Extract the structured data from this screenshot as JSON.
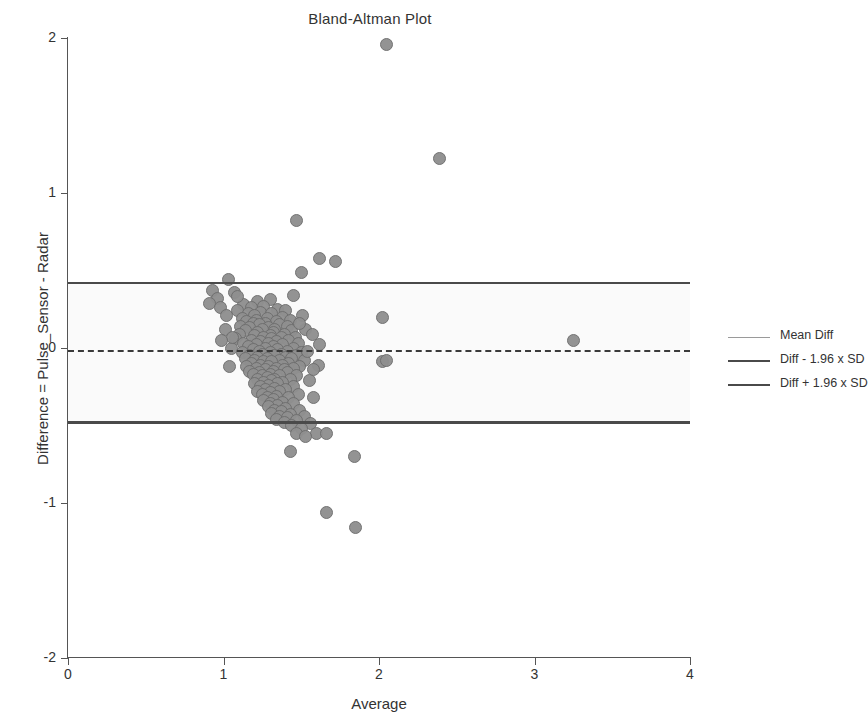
{
  "chart_data": {
    "type": "scatter",
    "title": "Bland-Altman Plot",
    "xlabel": "Average",
    "ylabel": "Difference = Pulse_Sensor - Radar",
    "xlim": [
      0,
      4
    ],
    "ylim": [
      -2,
      2
    ],
    "xticks": [
      "0",
      "1",
      "2",
      "3",
      "4"
    ],
    "yticks": [
      "2",
      "1",
      "0",
      "-1",
      "-2"
    ],
    "grid": false,
    "legend_position": "right",
    "marker": {
      "shape": "circle",
      "fill": "#8f8f8f",
      "edge": "#6e6e6e",
      "size": 13
    },
    "reference_lines": [
      {
        "name": "Mean Diff",
        "value": -0.02,
        "style": "dashed",
        "color": "#3a3a3a"
      },
      {
        "name": "Diff - 1.96 x SD",
        "value": -0.48,
        "style": "solid",
        "color": "#4a4a4a"
      },
      {
        "name": "Diff + 1.96 x SD",
        "value": 0.42,
        "style": "solid",
        "color": "#4a4a4a"
      }
    ],
    "band": {
      "from": -0.48,
      "to": 0.42,
      "color": "#fafafa"
    },
    "legend": [
      {
        "label": "Mean Diff",
        "swatch": "light"
      },
      {
        "label": "Diff - 1.96 x SD",
        "swatch": "solid"
      },
      {
        "label": "Diff + 1.96 x SD",
        "swatch": "solid"
      }
    ],
    "points": [
      [
        2.05,
        1.96
      ],
      [
        2.39,
        1.22
      ],
      [
        1.47,
        0.82
      ],
      [
        1.62,
        0.58
      ],
      [
        1.72,
        0.56
      ],
      [
        1.5,
        0.49
      ],
      [
        1.03,
        0.44
      ],
      [
        0.93,
        0.37
      ],
      [
        1.07,
        0.36
      ],
      [
        1.45,
        0.34
      ],
      [
        0.96,
        0.32
      ],
      [
        1.22,
        0.3
      ],
      [
        1.3,
        0.31
      ],
      [
        1.13,
        0.28
      ],
      [
        1.26,
        0.27
      ],
      [
        1.18,
        0.26
      ],
      [
        1.35,
        0.25
      ],
      [
        1.4,
        0.24
      ],
      [
        1.09,
        0.24
      ],
      [
        1.24,
        0.23
      ],
      [
        1.16,
        0.22
      ],
      [
        1.31,
        0.22
      ],
      [
        1.2,
        0.21
      ],
      [
        1.38,
        0.2
      ],
      [
        2.02,
        0.2
      ],
      [
        1.12,
        0.19
      ],
      [
        1.28,
        0.19
      ],
      [
        1.43,
        0.18
      ],
      [
        1.21,
        0.18
      ],
      [
        1.34,
        0.17
      ],
      [
        1.15,
        0.17
      ],
      [
        1.27,
        0.16
      ],
      [
        1.19,
        0.16
      ],
      [
        1.36,
        0.15
      ],
      [
        1.23,
        0.15
      ],
      [
        1.41,
        0.14
      ],
      [
        1.11,
        0.14
      ],
      [
        1.29,
        0.13
      ],
      [
        1.17,
        0.13
      ],
      [
        1.33,
        0.12
      ],
      [
        1.25,
        0.12
      ],
      [
        1.44,
        0.11
      ],
      [
        1.14,
        0.11
      ],
      [
        1.32,
        0.1
      ],
      [
        1.22,
        0.1
      ],
      [
        1.39,
        0.09
      ],
      [
        1.1,
        0.09
      ],
      [
        1.3,
        0.08
      ],
      [
        1.2,
        0.08
      ],
      [
        1.37,
        0.07
      ],
      [
        1.26,
        0.07
      ],
      [
        1.46,
        0.07
      ],
      [
        1.08,
        0.06
      ],
      [
        1.31,
        0.06
      ],
      [
        1.18,
        0.05
      ],
      [
        1.42,
        0.05
      ],
      [
        1.24,
        0.04
      ],
      [
        1.34,
        0.04
      ],
      [
        1.13,
        0.03
      ],
      [
        1.29,
        0.03
      ],
      [
        1.48,
        0.03
      ],
      [
        1.21,
        0.02
      ],
      [
        1.38,
        0.02
      ],
      [
        1.16,
        0.01
      ],
      [
        1.32,
        0.01
      ],
      [
        1.05,
        0.0
      ],
      [
        1.27,
        0.0
      ],
      [
        1.45,
        0.0
      ],
      [
        1.19,
        -0.01
      ],
      [
        1.35,
        -0.01
      ],
      [
        1.23,
        -0.02
      ],
      [
        1.41,
        -0.02
      ],
      [
        1.12,
        -0.03
      ],
      [
        1.3,
        -0.03
      ],
      [
        1.5,
        -0.03
      ],
      [
        1.25,
        -0.04
      ],
      [
        1.37,
        -0.04
      ],
      [
        1.17,
        -0.05
      ],
      [
        1.33,
        -0.05
      ],
      [
        1.47,
        -0.05
      ],
      [
        1.22,
        -0.06
      ],
      [
        1.4,
        -0.06
      ],
      [
        1.14,
        -0.07
      ],
      [
        1.28,
        -0.07
      ],
      [
        1.44,
        -0.07
      ],
      [
        1.2,
        -0.08
      ],
      [
        1.36,
        -0.08
      ],
      [
        1.52,
        -0.08
      ],
      [
        1.26,
        -0.09
      ],
      [
        1.31,
        -0.09
      ],
      [
        1.18,
        -0.1
      ],
      [
        1.42,
        -0.1
      ],
      [
        1.24,
        -0.11
      ],
      [
        1.38,
        -0.11
      ],
      [
        1.15,
        -0.12
      ],
      [
        1.29,
        -0.12
      ],
      [
        1.49,
        -0.12
      ],
      [
        1.21,
        -0.13
      ],
      [
        1.34,
        -0.13
      ],
      [
        1.45,
        -0.13
      ],
      [
        1.27,
        -0.14
      ],
      [
        1.39,
        -0.14
      ],
      [
        1.17,
        -0.15
      ],
      [
        1.32,
        -0.15
      ],
      [
        1.23,
        -0.16
      ],
      [
        1.41,
        -0.16
      ],
      [
        1.3,
        -0.17
      ],
      [
        1.19,
        -0.17
      ],
      [
        1.36,
        -0.18
      ],
      [
        1.25,
        -0.18
      ],
      [
        1.47,
        -0.18
      ],
      [
        1.28,
        -0.19
      ],
      [
        1.33,
        -0.2
      ],
      [
        1.22,
        -0.2
      ],
      [
        1.43,
        -0.2
      ],
      [
        1.31,
        -0.21
      ],
      [
        1.26,
        -0.22
      ],
      [
        1.38,
        -0.22
      ],
      [
        1.2,
        -0.23
      ],
      [
        1.35,
        -0.23
      ],
      [
        1.29,
        -0.24
      ],
      [
        1.24,
        -0.25
      ],
      [
        1.45,
        -0.25
      ],
      [
        1.33,
        -0.26
      ],
      [
        1.27,
        -0.27
      ],
      [
        1.4,
        -0.27
      ],
      [
        1.22,
        -0.28
      ],
      [
        1.36,
        -0.28
      ],
      [
        1.3,
        -0.29
      ],
      [
        1.25,
        -0.3
      ],
      [
        1.48,
        -0.3
      ],
      [
        1.34,
        -0.31
      ],
      [
        1.28,
        -0.32
      ],
      [
        1.58,
        -0.32
      ],
      [
        1.42,
        -0.32
      ],
      [
        1.32,
        -0.33
      ],
      [
        1.26,
        -0.34
      ],
      [
        1.38,
        -0.35
      ],
      [
        1.3,
        -0.36
      ],
      [
        1.45,
        -0.36
      ],
      [
        1.35,
        -0.37
      ],
      [
        1.29,
        -0.38
      ],
      [
        1.4,
        -0.39
      ],
      [
        1.33,
        -0.4
      ],
      [
        1.49,
        -0.4
      ],
      [
        1.37,
        -0.41
      ],
      [
        1.31,
        -0.42
      ],
      [
        1.43,
        -0.43
      ],
      [
        1.36,
        -0.44
      ],
      [
        1.52,
        -0.44
      ],
      [
        1.41,
        -0.45
      ],
      [
        1.34,
        -0.46
      ],
      [
        1.47,
        -0.47
      ],
      [
        1.39,
        -0.48
      ],
      [
        1.56,
        -0.49
      ],
      [
        1.44,
        -0.5
      ],
      [
        1.5,
        -0.52
      ],
      [
        1.6,
        -0.55
      ],
      [
        1.66,
        -0.55
      ],
      [
        1.47,
        -0.55
      ],
      [
        1.53,
        -0.57
      ],
      [
        1.43,
        -0.67
      ],
      [
        1.84,
        -0.7
      ],
      [
        1.66,
        -1.06
      ],
      [
        1.85,
        -1.16
      ],
      [
        0.91,
        0.29
      ],
      [
        0.98,
        0.26
      ],
      [
        1.01,
        0.12
      ],
      [
        1.04,
        -0.12
      ],
      [
        1.06,
        0.07
      ],
      [
        2.02,
        -0.09
      ],
      [
        2.05,
        -0.08
      ],
      [
        3.25,
        0.05
      ],
      [
        1.53,
        0.12
      ],
      [
        1.57,
        0.09
      ],
      [
        1.61,
        -0.11
      ],
      [
        1.55,
        -0.21
      ],
      [
        1.51,
        0.21
      ],
      [
        1.49,
        0.16
      ],
      [
        1.54,
        -0.02
      ],
      [
        1.58,
        -0.14
      ],
      [
        1.62,
        0.02
      ],
      [
        1.09,
        0.33
      ],
      [
        1.02,
        0.21
      ],
      [
        0.99,
        0.05
      ]
    ]
  }
}
